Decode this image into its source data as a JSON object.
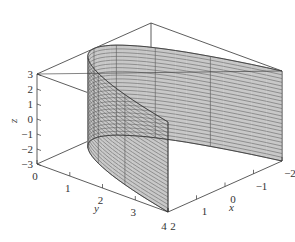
{
  "chart_data": {
    "type": "surface3d",
    "title": "",
    "surface": {
      "equation": "y = x^2",
      "x_range": [
        -2,
        2
      ],
      "z_range": [
        -3,
        3
      ],
      "u_lines": 9,
      "z_lines": 25
    },
    "xlabel": "x",
    "ylabel": "y",
    "zlabel": "z",
    "xlim": [
      -2,
      2
    ],
    "ylim": [
      0,
      4
    ],
    "zlim": [
      -3,
      3
    ],
    "x_ticks": [
      "2",
      "1",
      "0",
      "−1",
      "−2"
    ],
    "x_tick_values": [
      2,
      1,
      0,
      -1,
      -2
    ],
    "y_ticks": [
      "0",
      "1",
      "2",
      "3",
      "4"
    ],
    "y_tick_values": [
      0,
      1,
      2,
      3,
      4
    ],
    "z_ticks": [
      "3",
      "2",
      "1",
      "0",
      "−1",
      "−2",
      "−3"
    ],
    "z_tick_values": [
      3,
      2,
      1,
      0,
      -1,
      -2,
      -3
    ],
    "grid": false,
    "box": true,
    "colors": {
      "surface_fill": "#c8c8c8",
      "mesh_line": "#555555",
      "box_line": "#333333"
    }
  }
}
